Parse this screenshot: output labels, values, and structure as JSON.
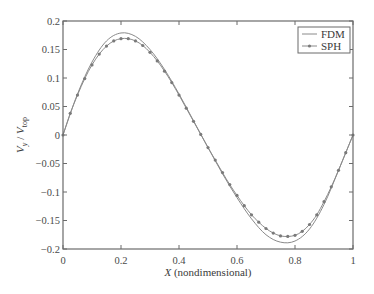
{
  "chart_data": {
    "type": "line",
    "title": "",
    "xlabel_italic": "X",
    "xlabel_rest": "(nondimensional)",
    "xlabel": "X (nondimensional)",
    "ylabel": "V_y / V_top",
    "ylabel_main1": "V",
    "ylabel_sub1": "y",
    "ylabel_sep": " / ",
    "ylabel_main2": "V",
    "ylabel_sub2": "top",
    "xlim": [
      0,
      1
    ],
    "ylim": [
      -0.2,
      0.2
    ],
    "xticks": [
      0,
      0.2,
      0.4,
      0.6,
      0.8,
      1
    ],
    "xtick_labels": [
      "0",
      "0.2",
      "0.4",
      "0.6",
      "0.8",
      "1"
    ],
    "yticks": [
      0.2,
      0.15,
      0.1,
      0.05,
      0,
      -0.05,
      -0.1,
      -0.15,
      -0.2
    ],
    "ytick_labels": [
      "0.2",
      "0.15",
      "0.1",
      "0.05",
      "0",
      "−0.05",
      "−0.1",
      "−0.15",
      "−0.2"
    ],
    "grid": false,
    "legend_position": "upper right",
    "series": [
      {
        "name": "FDM",
        "style": "solid line",
        "color": "#8a8a8a",
        "x": [
          0,
          0.05,
          0.1,
          0.15,
          0.2,
          0.25,
          0.3,
          0.35,
          0.4,
          0.45,
          0.5,
          0.55,
          0.6,
          0.65,
          0.7,
          0.75,
          0.8,
          0.85,
          0.9,
          0.95,
          1
        ],
        "values": [
          0,
          0.072,
          0.128,
          0.165,
          0.179,
          0.173,
          0.15,
          0.115,
          0.072,
          0.025,
          -0.022,
          -0.068,
          -0.11,
          -0.147,
          -0.175,
          -0.188,
          -0.186,
          -0.165,
          -0.122,
          -0.062,
          0
        ]
      },
      {
        "name": "SPH",
        "style": "line with dot markers",
        "color": "#8a8a8a",
        "x": [
          0,
          0.025,
          0.05,
          0.075,
          0.1,
          0.125,
          0.15,
          0.175,
          0.2,
          0.225,
          0.25,
          0.275,
          0.3,
          0.325,
          0.35,
          0.375,
          0.4,
          0.425,
          0.45,
          0.475,
          0.5,
          0.525,
          0.55,
          0.575,
          0.6,
          0.625,
          0.65,
          0.675,
          0.7,
          0.725,
          0.75,
          0.775,
          0.8,
          0.825,
          0.85,
          0.875,
          0.9,
          0.925,
          0.95,
          0.975,
          1
        ],
        "values": [
          0,
          0.038,
          0.07,
          0.099,
          0.123,
          0.142,
          0.156,
          0.165,
          0.169,
          0.169,
          0.165,
          0.157,
          0.145,
          0.13,
          0.112,
          0.092,
          0.07,
          0.047,
          0.024,
          0.001,
          -0.022,
          -0.044,
          -0.066,
          -0.087,
          -0.106,
          -0.124,
          -0.14,
          -0.153,
          -0.164,
          -0.172,
          -0.177,
          -0.178,
          -0.176,
          -0.169,
          -0.157,
          -0.14,
          -0.117,
          -0.091,
          -0.062,
          -0.031,
          0
        ]
      }
    ]
  }
}
